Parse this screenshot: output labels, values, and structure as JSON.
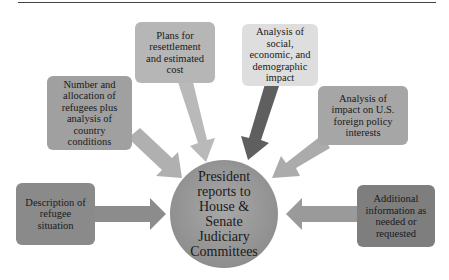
{
  "diagram": {
    "type": "hub-and-spoke flowchart",
    "center": {
      "label": "President reports to House & Senate Judiciary Committees",
      "lines": [
        "President",
        "reports to",
        "House &",
        "Senate",
        "Judiciary",
        "Committees"
      ],
      "color": "#979797"
    },
    "inputs": [
      {
        "id": "description",
        "label": "Description of refugee situation",
        "lines": [
          "Description of",
          "refugee",
          "situation"
        ],
        "color": "#8a8a8a",
        "arrow_color": "#8c8c8c"
      },
      {
        "id": "number-allocation",
        "label": "Number and allocation of refugees plus analysis of country conditions",
        "lines": [
          "Number and",
          "allocation of",
          "refugees plus",
          "analysis of",
          "country",
          "conditions"
        ],
        "color": "#a0a0a0",
        "arrow_color": "#b0b0b0"
      },
      {
        "id": "resettlement-plans",
        "label": "Plans for resettlement and estimated cost",
        "lines": [
          "Plans for",
          "resettlement",
          "and estimated",
          "cost"
        ],
        "color": "#b6b6b6",
        "arrow_color": "#b9b9b9"
      },
      {
        "id": "social-economic",
        "label": "Analysis of social, economic, and demographic impact",
        "lines": [
          "Analysis of",
          "social,",
          "economic, and",
          "demographic",
          "impact"
        ],
        "color": "#dedede",
        "arrow_color": "#5f5f5f"
      },
      {
        "id": "foreign-policy",
        "label": "Analysis of impact on U.S. foreign policy interests",
        "lines": [
          "Analysis of",
          "impact on U.S.",
          "foreign policy",
          "interests"
        ],
        "color": "#a6a6a6",
        "arrow_color": "#ababab"
      },
      {
        "id": "additional-info",
        "label": "Additional information as needed or requested",
        "lines": [
          "Additional",
          "information as",
          "needed or",
          "requested"
        ],
        "color": "#7e7e7e",
        "arrow_color": "#9a9a9a"
      }
    ]
  }
}
